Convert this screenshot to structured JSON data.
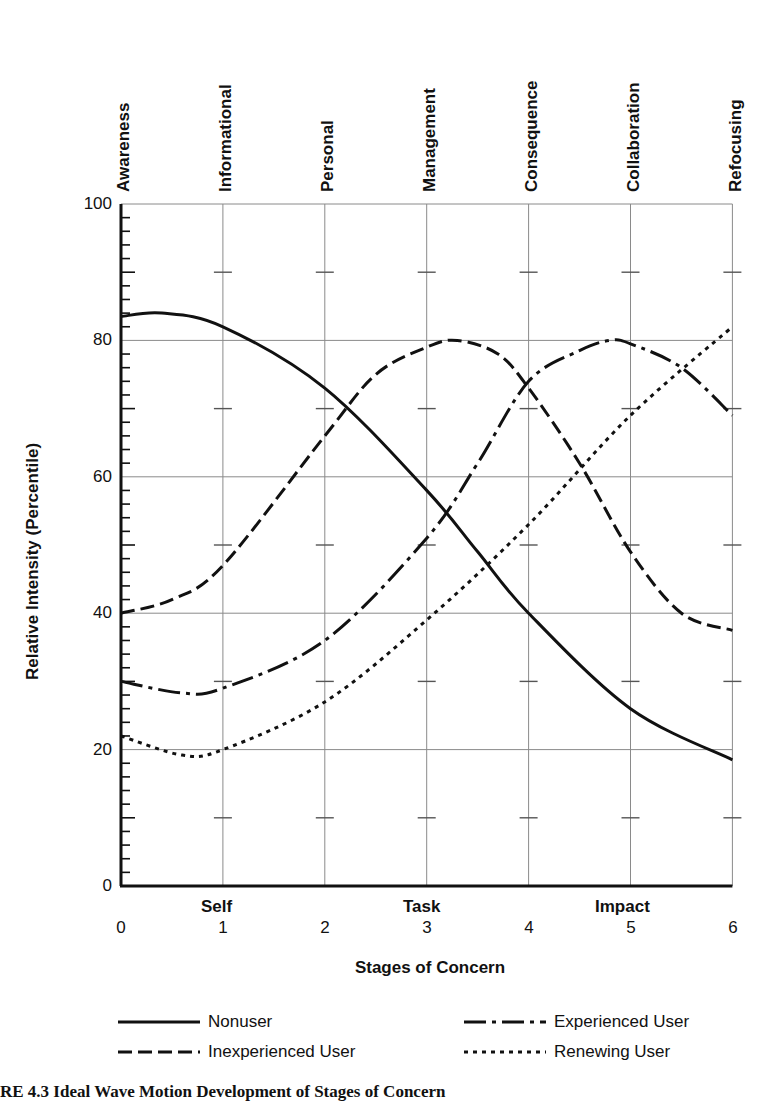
{
  "chart_data": {
    "type": "line",
    "title": "",
    "xlabel": "Stages of Concern",
    "ylabel": "Relative Intensity (Percentile)",
    "xlim": [
      0,
      6
    ],
    "ylim": [
      0,
      100
    ],
    "grid": true,
    "legend_position": "bottom",
    "x_ticks": [
      "0",
      "1",
      "2",
      "3",
      "4",
      "5",
      "6"
    ],
    "y_ticks": [
      "0",
      "20",
      "40",
      "60",
      "80",
      "100"
    ],
    "stage_names": [
      "Awareness",
      "Informational",
      "Personal",
      "Management",
      "Consequence",
      "Collaboration",
      "Refocusing"
    ],
    "stage_groups": [
      {
        "label": "Self",
        "x": 1
      },
      {
        "label": "Task",
        "x": 3
      },
      {
        "label": "Impact",
        "x": 5
      }
    ],
    "series": [
      {
        "name": "Nonuser",
        "style": "solid",
        "x": [
          0,
          0.4,
          1,
          2,
          3,
          3.5,
          4,
          5,
          6
        ],
        "values": [
          83.5,
          84,
          82,
          73,
          58,
          49,
          40,
          26,
          18.5
        ]
      },
      {
        "name": "Inexperienced User",
        "style": "dashed",
        "x": [
          0,
          0.5,
          1,
          2,
          2.5,
          3,
          3.3,
          3.7,
          4,
          4.5,
          5,
          5.5,
          6
        ],
        "values": [
          40,
          42,
          47,
          66,
          75,
          79,
          80,
          78,
          73,
          62,
          49,
          40,
          37.5
        ]
      },
      {
        "name": "Experienced User",
        "style": "dash-dot",
        "x": [
          0,
          0.6,
          1,
          2,
          3,
          3.5,
          4,
          4.5,
          4.8,
          5,
          5.5,
          6
        ],
        "values": [
          30,
          28.3,
          29,
          36,
          51,
          62,
          74,
          78.5,
          80,
          79.5,
          76,
          69
        ]
      },
      {
        "name": "Renewing User",
        "style": "dotted",
        "x": [
          0,
          0.6,
          1,
          2,
          3,
          4,
          5,
          6
        ],
        "values": [
          22,
          19.2,
          20,
          27,
          39,
          53,
          69,
          82
        ]
      }
    ]
  },
  "labels": {
    "stage_0": "Awareness",
    "stage_1": "Informational",
    "stage_2": "Personal",
    "stage_3": "Management",
    "stage_4": "Consequence",
    "stage_5": "Collaboration",
    "stage_6": "Refocusing",
    "y_0": "0",
    "y_20": "20",
    "y_40": "40",
    "y_60": "60",
    "y_80": "80",
    "y_100": "100",
    "x_0": "0",
    "x_1": "1",
    "x_2": "2",
    "x_3": "3",
    "x_4": "4",
    "x_5": "5",
    "x_6": "6",
    "group_self": "Self",
    "group_task": "Task",
    "group_impact": "Impact",
    "x_axis_title": "Stages of Concern",
    "y_axis_title": "Relative Intensity (Percentile)"
  },
  "legend": {
    "nonuser": "Nonuser",
    "experienced": "Experienced User",
    "inexperienced": "Inexperienced User",
    "renewing": "Renewing User"
  },
  "caption": "RE 4.3   Ideal Wave Motion Development of Stages of Concern"
}
